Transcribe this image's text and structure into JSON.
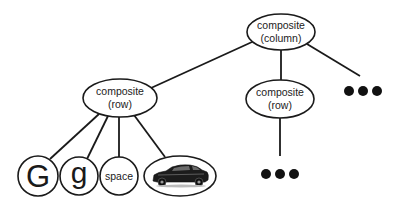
{
  "diagram": {
    "type": "tree",
    "nodes": {
      "root": {
        "line1": "composite",
        "line2": "(column)"
      },
      "row_left": {
        "line1": "composite",
        "line2": "(row)"
      },
      "row_right": {
        "line1": "composite",
        "line2": "(row)"
      },
      "leaf_G": {
        "label": "G"
      },
      "leaf_g": {
        "label": "g"
      },
      "leaf_space": {
        "label": "space"
      },
      "leaf_car": {
        "label": "",
        "icon": "car-image"
      }
    },
    "ellipsis_symbol": "●●●",
    "edges": [
      [
        "root",
        "row_left"
      ],
      [
        "root",
        "row_right"
      ],
      [
        "root",
        "more_columns"
      ],
      [
        "row_left",
        "leaf_G"
      ],
      [
        "row_left",
        "leaf_g"
      ],
      [
        "row_left",
        "leaf_space"
      ],
      [
        "row_left",
        "leaf_car"
      ],
      [
        "row_right",
        "more_leaves"
      ]
    ],
    "colors": {
      "stroke": "#1a1a1a",
      "fill": "#ffffff",
      "text": "#222222"
    }
  }
}
